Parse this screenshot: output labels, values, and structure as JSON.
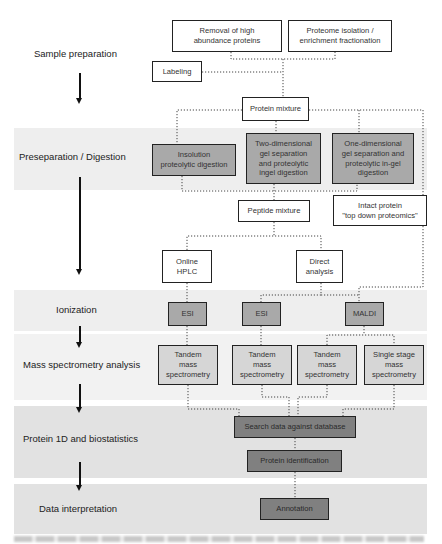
{
  "stages": [
    {
      "id": "sample-preparation",
      "label": "Sample preparation"
    },
    {
      "id": "preseparation-digestion",
      "label": "Preseparation / Digestion"
    },
    {
      "id": "ionization",
      "label": "Ionization"
    },
    {
      "id": "mass-spectrometry-analysis",
      "label": "Mass spectrometry analysis"
    },
    {
      "id": "protein-id-biostatistics",
      "label": "Protein 1D and biostatistics"
    },
    {
      "id": "data-interpretation",
      "label": "Data interpretation"
    }
  ],
  "boxes": {
    "removal": "Removal of high\nabundance proteins",
    "proteome_isolation": "Proteome isolation /\nenrichment fractionation",
    "labeling": "Labeling",
    "protein_mixture": "Protein mixture",
    "insolution": "Insolution\nproteolytic digestion",
    "two_dim": "Two-dimensional\ngel separation\nand proteolytic\ningel digestion",
    "one_dim": "One-dimensional\ngel separation and\nproteolytic in-gel\ndigestion",
    "peptide_mixture": "Peptide mixture",
    "intact_protein": "Intact protein\n\"top down proteomics\"",
    "online_hplc": "Online\nHPLC",
    "direct_analysis": "Direct\nanalysis",
    "esi_1": "ESI",
    "esi_2": "ESI",
    "maldi": "MALDI",
    "tandem_ms_1": "Tandem\nmass\nspectrometry",
    "tandem_ms_2": "Tandem\nmass\nspectrometry",
    "tandem_ms_3": "Tandem\nmass\nspectrometry",
    "single_stage_ms": "Single stage\nmass\nspectrometry",
    "search_database": "Search data against database",
    "protein_identification": "Protein identification",
    "annotation": "Annotation"
  },
  "colors": {
    "band": "#eeeeee",
    "band_dark": "#e2e2e2",
    "box_gray": "#a9a9a9",
    "box_light": "#d6d6d6",
    "box_dark": "#808080",
    "border": "#222222"
  }
}
